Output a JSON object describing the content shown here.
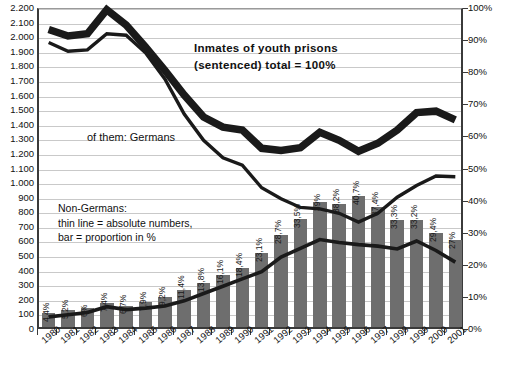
{
  "chart_data": {
    "type": "bar",
    "title": "Inmates of youth prisons (sentenced) total = 100%",
    "xlabel": "",
    "ylabel": "",
    "grid": true,
    "legend_position": "inline-annotations",
    "categories": [
      "1980",
      "1981",
      "1982",
      "1983",
      "1984",
      "1985",
      "1986",
      "1987",
      "1988",
      "1989",
      "1990",
      "1991",
      "1992",
      "1993",
      "1994",
      "1995",
      "1996",
      "1997",
      "1998",
      "1999",
      "2000",
      "2001"
    ],
    "left_axis": {
      "label": "",
      "ylim": [
        0,
        2200
      ],
      "tick_step": 100,
      "ticks": [
        "0",
        "100",
        "200",
        "300",
        "400",
        "500",
        "600",
        "700",
        "800",
        "900",
        "1.000",
        "1.100",
        "1.200",
        "1.300",
        "1.400",
        "1.500",
        "1.600",
        "1.700",
        "1.800",
        "1.900",
        "2.000",
        "2.100",
        "2.200"
      ]
    },
    "right_axis": {
      "label": "",
      "ylim": [
        0,
        100
      ],
      "tick_step": 10,
      "ticks": [
        "0%",
        "10%",
        "20%",
        "30%",
        "40%",
        "50%",
        "60%",
        "70%",
        "80%",
        "90%",
        "100%"
      ]
    },
    "series": [
      {
        "name": "Inmates of youth prisons (sentenced) total = 100%",
        "style": "thick-line",
        "axis": "left",
        "color": "#1a1a1a",
        "values": [
          2060,
          2015,
          2030,
          2195,
          2090,
          1940,
          1780,
          1610,
          1460,
          1390,
          1370,
          1245,
          1230,
          1250,
          1355,
          1300,
          1225,
          1280,
          1370,
          1490,
          1500,
          1440
        ]
      },
      {
        "name": "of them: Germans",
        "style": "thin-line",
        "axis": "left",
        "color": "#1a1a1a",
        "values": [
          1970,
          1910,
          1920,
          2030,
          2020,
          1900,
          1720,
          1480,
          1300,
          1180,
          1130,
          975,
          900,
          840,
          830,
          800,
          740,
          800,
          910,
          990,
          1055,
          1050
        ]
      },
      {
        "name": "Non-Germans: absolute numbers",
        "style": "medium-line",
        "axis": "left",
        "color": "#1a1a1a",
        "values": [
          90,
          105,
          120,
          160,
          140,
          150,
          165,
          200,
          250,
          300,
          350,
          400,
          500,
          560,
          620,
          600,
          585,
          575,
          555,
          610,
          545,
          465
        ]
      },
      {
        "name": "Non-Germans: proportion in %",
        "style": "bar",
        "axis": "right",
        "color": "#6e6e6e",
        "values": [
          4.4,
          5.2,
          6,
          7.4,
          6.7,
          7.9,
          9.2,
          11.4,
          13.8,
          16.1,
          18.4,
          23.1,
          28.7,
          33.5,
          39,
          38.2,
          40.7,
          37.4,
          33.3,
          33.2,
          29.4,
          27
        ]
      }
    ],
    "bar_labels": [
      "4,4%",
      "5,2%",
      "6%",
      "7,4%",
      "6,7%",
      "7,9%",
      "9,2%",
      "11,4%",
      "13,8%",
      "16,1%",
      "18,4%",
      "23,1%",
      "28,7%",
      "33,5%",
      "39%",
      "38,2%",
      "40,7%",
      "37,4%",
      "33,3%",
      "33,2%",
      "29,4%",
      "27%"
    ],
    "annotations": [
      {
        "id": "title",
        "lines": [
          "Inmates of youth prisons",
          "(sentenced) total = 100%"
        ]
      },
      {
        "id": "germans",
        "lines": [
          "of them: Germans"
        ]
      },
      {
        "id": "nongermans",
        "lines": [
          "Non-Germans:",
          "thin line = absolute numbers,",
          "bar = proportion in %"
        ]
      }
    ],
    "colors": {
      "bar": "#6e6e6e",
      "line": "#1a1a1a",
      "grid": "#c9c9c9",
      "axis": "#3a3a3a",
      "background": "#ffffff"
    }
  }
}
